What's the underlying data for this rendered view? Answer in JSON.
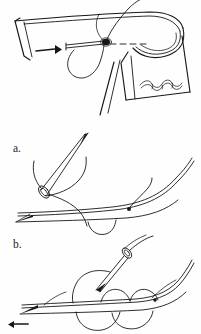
{
  "figure": {
    "background_color": "#fefefe",
    "ink_color": "#17171a",
    "width": 201,
    "height": 334,
    "panels": [
      {
        "id": "top",
        "label": "",
        "caption": "Folded hem with needle passing through fold, thread drawn up",
        "elements": [
          "folded-hem-corner",
          "hem-fold-edge",
          "rolled-cuff-curve",
          "direction-arrow",
          "needle-in-fabric",
          "needle-eye-knot",
          "thread-tail",
          "dashed-stitch-line",
          "thread-loop-below",
          "decorative-scallop-trim"
        ]
      },
      {
        "id": "a",
        "label": "a.",
        "caption": "Needle angled down through folded edge; thread loop under fabric",
        "elements": [
          "needle-shaft",
          "needle-point",
          "needle-eye",
          "thread-through-eye",
          "fabric-upper-edge",
          "fabric-lower-edge",
          "stitch-loop-under",
          "thread-end-knot"
        ]
      },
      {
        "id": "b",
        "label": "b.",
        "caption": "Needle entering fabric to form next stitch; completed loops shown",
        "elements": [
          "needle-shaft",
          "needle-point",
          "needle-eye",
          "thread-through-eye",
          "fabric-upper-edge",
          "fabric-lower-edge",
          "stitch-arc-1",
          "stitch-arc-2",
          "under-loop-1",
          "under-loop-2",
          "direction-arrow-small",
          "thread-end-knot"
        ]
      }
    ],
    "labels": {
      "panel_a": "a.",
      "panel_b": "b."
    }
  }
}
